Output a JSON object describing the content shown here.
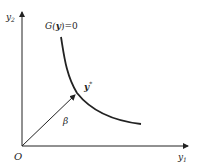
{
  "diagram": {
    "axes": {
      "y_label": "y",
      "y_label_sub": "2",
      "x_label": "y",
      "x_label_sub": "1",
      "origin_label": "O"
    },
    "curve": {
      "equation_label_pre": "G(",
      "equation_label_var": "y",
      "equation_label_post": ")=0"
    },
    "point": {
      "label": "y",
      "label_sup": "*"
    },
    "vector": {
      "label": "β"
    },
    "colors": {
      "line": "#222222",
      "background": "#ffffff"
    }
  }
}
